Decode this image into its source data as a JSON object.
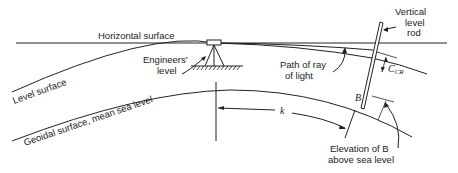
{
  "diagram": {
    "labels": {
      "horizontal_surface": "Horizontal surface",
      "engineers_level_1": "Engineers'",
      "engineers_level_2": "level",
      "level_surface": "Level surface",
      "geoidal_surface": "Geoidal surface, mean sea level",
      "path_of_ray_1": "Path of ray",
      "path_of_ray_2": "of light",
      "vertical_rod_1": "Vertical",
      "vertical_rod_2": "level",
      "vertical_rod_3": "rod",
      "ccr": "C",
      "ccr_sub": "CR",
      "point_b": "B",
      "k": "k",
      "elevation_1": "Elevation of B",
      "elevation_2": "above sea level"
    },
    "colors": {
      "line": "#222222",
      "background": "#ffffff"
    }
  }
}
